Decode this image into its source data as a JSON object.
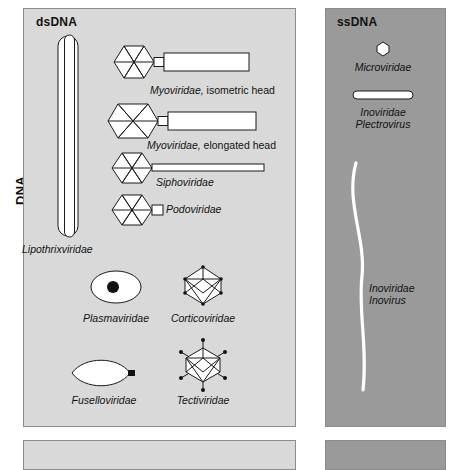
{
  "figure": {
    "row_label": "DNA",
    "panels": [
      {
        "id": "dsdna",
        "title": "dsDNA",
        "background": "#d9d9d9",
        "items": [
          {
            "name": "Lipothrixviridae",
            "label": "Lipothrixviridae",
            "label2": "",
            "shape": "rod-sheathed"
          },
          {
            "name": "Myoviridae-isometric",
            "label": "Myoviridae,",
            "label2": " isometric head",
            "shape": "icosahedral-head-contractile-tail"
          },
          {
            "name": "Myoviridae-elongated",
            "label": "Myoviridae,",
            "label2": " elongated head",
            "shape": "prolate-head-contractile-tail"
          },
          {
            "name": "Siphoviridae",
            "label": "Siphoviridae",
            "label2": "",
            "shape": "icosahedral-head-long-tail"
          },
          {
            "name": "Podoviridae",
            "label": "Podoviridae",
            "label2": "",
            "shape": "icosahedral-head-short-tail"
          },
          {
            "name": "Plasmaviridae",
            "label": "Plasmaviridae",
            "label2": "",
            "shape": "pleomorphic-ellipse-nucleoid"
          },
          {
            "name": "Corticoviridae",
            "label": "Corticoviridae",
            "label2": "",
            "shape": "icosahedron-vertex-dots"
          },
          {
            "name": "Fuselloviridae",
            "label": "Fuselloviridae",
            "label2": "",
            "shape": "lemon-spindle"
          },
          {
            "name": "Tectiviridae",
            "label": "Tectiviridae",
            "label2": "",
            "shape": "icosahedron-spikes"
          }
        ]
      },
      {
        "id": "ssdna",
        "title": "ssDNA",
        "background": "#9a9a9a",
        "items": [
          {
            "name": "Microviridae",
            "label": "Microviridae",
            "label2": "",
            "shape": "small-icosahedron"
          },
          {
            "name": "Inoviridae-Plectrovirus",
            "label": "Inoviridae",
            "label2": "Plectrovirus",
            "shape": "short-rod"
          },
          {
            "name": "Inoviridae-Inovirus",
            "label": "Inoviridae",
            "label2": "Inovirus",
            "shape": "long-flexible-filament"
          }
        ]
      }
    ]
  }
}
